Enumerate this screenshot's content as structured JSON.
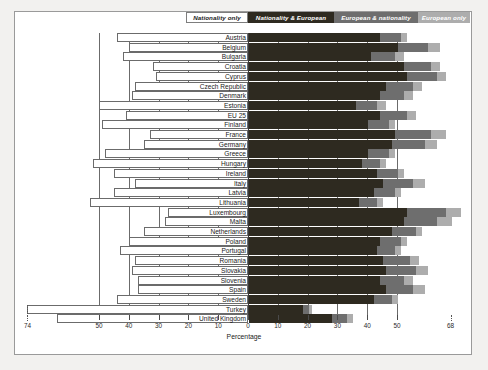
{
  "chart_data": {
    "type": "bar",
    "subtype": "diverging-stacked-bar",
    "title": "",
    "xlabel": "Percentage",
    "ylabel": "",
    "grid": true,
    "legend_position": "top",
    "xticks_left": [
      74,
      50,
      40,
      30,
      20,
      10,
      0
    ],
    "xticks_right": [
      10,
      20,
      30,
      40,
      50,
      68
    ],
    "xlim": [
      -74,
      68
    ],
    "series": [
      {
        "name": "Nationality only",
        "color": "#ffffff",
        "direction": "left"
      },
      {
        "name": "Nationality & European",
        "color": "#2e2a20",
        "direction": "right"
      },
      {
        "name": "European & nationality",
        "color": "#6e6e6e",
        "direction": "right"
      },
      {
        "name": "European only",
        "color": "#adadad",
        "direction": "right"
      }
    ],
    "categories": [
      "Austria",
      "Belgium",
      "Bulgaria",
      "Croatia",
      "Cyprus",
      "Czech Republic",
      "Denmark",
      "Estonia",
      "EU 25",
      "Finland",
      "France",
      "Germany",
      "Greece",
      "Hungary",
      "Ireland",
      "Italy",
      "Latvia",
      "Lithuania",
      "Luxembourg",
      "Malta",
      "Netherlands",
      "Poland",
      "Portugal",
      "Romania",
      "Slovakia",
      "Slovenia",
      "Spain",
      "Sweden",
      "Turkey",
      "United Kingdom"
    ],
    "rows": [
      {
        "country": "Austria",
        "nationality_only": 44,
        "nationality_european": 44,
        "european_nationality": 7,
        "european_only": 2,
        "truncated": false
      },
      {
        "country": "Belgium",
        "nationality_only": 40,
        "nationality_european": 50,
        "european_nationality": 10,
        "european_only": 4,
        "truncated": false
      },
      {
        "country": "Bulgaria",
        "nationality_only": 42,
        "nationality_european": 41,
        "european_nationality": 8,
        "european_only": 3,
        "truncated": false
      },
      {
        "country": "Croatia",
        "nationality_only": 32,
        "nationality_european": 52,
        "european_nationality": 9,
        "european_only": 3,
        "truncated": false
      },
      {
        "country": "Cyprus",
        "nationality_only": 31,
        "nationality_european": 53,
        "european_nationality": 10,
        "european_only": 3,
        "truncated": false
      },
      {
        "country": "Czech Republic",
        "nationality_only": 38,
        "nationality_european": 46,
        "european_nationality": 9,
        "european_only": 3,
        "truncated": false
      },
      {
        "country": "Denmark",
        "nationality_only": 39,
        "nationality_european": 44,
        "european_nationality": 8,
        "european_only": 3,
        "truncated": false
      },
      {
        "country": "Estonia",
        "nationality_only": 50,
        "nationality_european": 36,
        "european_nationality": 7,
        "european_only": 3,
        "truncated": false
      },
      {
        "country": "EU 25",
        "nationality_only": 41,
        "nationality_european": 44,
        "european_nationality": 9,
        "european_only": 3,
        "truncated": false
      },
      {
        "country": "Finland",
        "nationality_only": 49,
        "nationality_european": 40,
        "european_nationality": 7,
        "european_only": 2,
        "truncated": false
      },
      {
        "country": "France",
        "nationality_only": 33,
        "nationality_european": 49,
        "european_nationality": 12,
        "european_only": 5,
        "truncated": false
      },
      {
        "country": "Germany",
        "nationality_only": 35,
        "nationality_european": 48,
        "european_nationality": 11,
        "european_only": 4,
        "truncated": false
      },
      {
        "country": "Greece",
        "nationality_only": 48,
        "nationality_european": 40,
        "european_nationality": 7,
        "european_only": 2,
        "truncated": false
      },
      {
        "country": "Hungary",
        "nationality_only": 52,
        "nationality_european": 38,
        "european_nationality": 6,
        "european_only": 2,
        "truncated": false
      },
      {
        "country": "Ireland",
        "nationality_only": 45,
        "nationality_european": 43,
        "european_nationality": 7,
        "european_only": 2,
        "truncated": false
      },
      {
        "country": "Italy",
        "nationality_only": 38,
        "nationality_european": 45,
        "european_nationality": 10,
        "european_only": 4,
        "truncated": false
      },
      {
        "country": "Latvia",
        "nationality_only": 45,
        "nationality_european": 42,
        "european_nationality": 7,
        "european_only": 2,
        "truncated": false
      },
      {
        "country": "Lithuania",
        "nationality_only": 53,
        "nationality_european": 37,
        "european_nationality": 6,
        "european_only": 2,
        "truncated": false
      },
      {
        "country": "Luxembourg",
        "nationality_only": 27,
        "nationality_european": 53,
        "european_nationality": 13,
        "european_only": 5,
        "truncated": false
      },
      {
        "country": "Malta",
        "nationality_only": 28,
        "nationality_european": 52,
        "european_nationality": 11,
        "european_only": 5,
        "truncated": false
      },
      {
        "country": "Netherlands",
        "nationality_only": 35,
        "nationality_european": 48,
        "european_nationality": 8,
        "european_only": 2,
        "truncated": false
      },
      {
        "country": "Poland",
        "nationality_only": 40,
        "nationality_european": 44,
        "european_nationality": 7,
        "european_only": 2,
        "truncated": false
      },
      {
        "country": "Portugal",
        "nationality_only": 43,
        "nationality_european": 43,
        "european_nationality": 6,
        "european_only": 2,
        "truncated": false
      },
      {
        "country": "Romania",
        "nationality_only": 38,
        "nationality_european": 45,
        "european_nationality": 9,
        "european_only": 3,
        "truncated": false
      },
      {
        "country": "Slovakia",
        "nationality_only": 39,
        "nationality_european": 46,
        "european_nationality": 10,
        "european_only": 4,
        "truncated": false
      },
      {
        "country": "Slovenia",
        "nationality_only": 37,
        "nationality_european": 44,
        "european_nationality": 8,
        "european_only": 3,
        "truncated": false
      },
      {
        "country": "Spain",
        "nationality_only": 37,
        "nationality_european": 46,
        "european_nationality": 9,
        "european_only": 4,
        "truncated": false
      },
      {
        "country": "Sweden",
        "nationality_only": 44,
        "nationality_european": 42,
        "european_nationality": 6,
        "european_only": 2,
        "truncated": false
      },
      {
        "country": "Turkey",
        "nationality_only": 74,
        "nationality_european": 18,
        "european_nationality": 2,
        "european_only": 1,
        "truncated": true
      },
      {
        "country": "United Kingdom",
        "nationality_only": 64,
        "nationality_european": 28,
        "european_nationality": 5,
        "european_only": 2,
        "truncated": false
      }
    ]
  },
  "legend": {
    "items": [
      {
        "label": "Nationality only"
      },
      {
        "label": "Nationality & European"
      },
      {
        "label": "European & nationality"
      },
      {
        "label": "European only"
      }
    ]
  },
  "axis": {
    "title": "Percentage",
    "left_labels": [
      "74",
      "50",
      "40",
      "30",
      "20",
      "10",
      "0"
    ],
    "right_labels": [
      "10",
      "20",
      "30",
      "40",
      "50",
      "68"
    ]
  }
}
